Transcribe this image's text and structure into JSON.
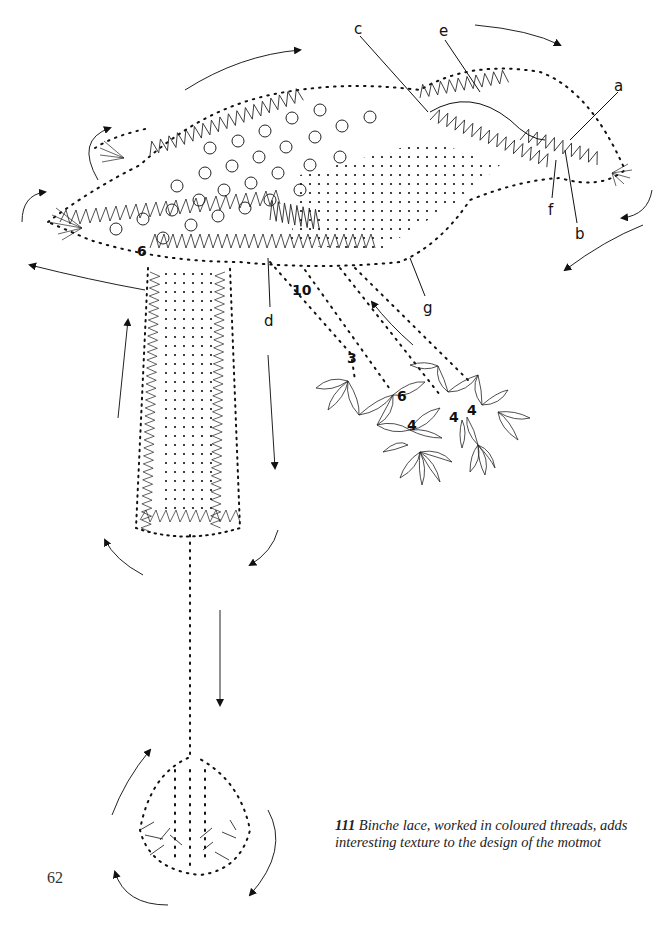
{
  "figure": {
    "part_labels": [
      {
        "id": "a",
        "text": "a",
        "x": 619,
        "y": 82
      },
      {
        "id": "b",
        "text": "b",
        "x": 576,
        "y": 231
      },
      {
        "id": "c",
        "text": "c",
        "x": 353,
        "y": 24
      },
      {
        "id": "d",
        "text": "d",
        "x": 265,
        "y": 318
      },
      {
        "id": "e",
        "text": "e",
        "x": 438,
        "y": 26
      },
      {
        "id": "f",
        "text": "f",
        "x": 547,
        "y": 207
      },
      {
        "id": "g",
        "text": "g",
        "x": 423,
        "y": 305
      }
    ],
    "pair_counts": [
      {
        "text": "6",
        "x": 139,
        "y": 248
      },
      {
        "text": "10",
        "x": 292,
        "y": 286
      },
      {
        "text": "3",
        "x": 347,
        "y": 353
      },
      {
        "text": "6",
        "x": 397,
        "y": 390
      },
      {
        "text": "4",
        "x": 408,
        "y": 420
      },
      {
        "text": "4",
        "x": 448,
        "y": 411
      },
      {
        "text": "4",
        "x": 467,
        "y": 403
      }
    ]
  },
  "caption": {
    "number": "111",
    "text": " Binche lace, worked in coloured threads, adds interesting texture to the design of the motmot"
  },
  "page_number": "62"
}
